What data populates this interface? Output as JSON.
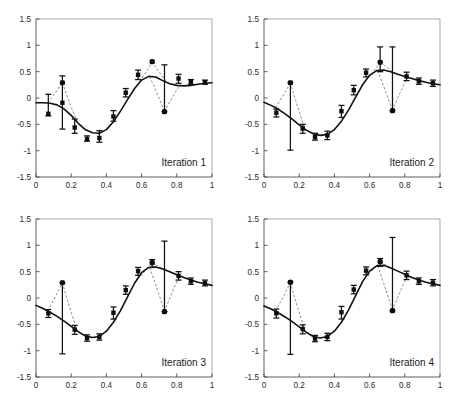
{
  "figure": {
    "title": "",
    "panel_count": 4,
    "background_color": "#ffffff",
    "curve_color": "#111111",
    "marker_color": "#0d0d0d",
    "dashed_link_color": "#6e6e6e",
    "axis_color": "#4d4d4d"
  },
  "axes": {
    "xlim": [
      0,
      1
    ],
    "ylim": [
      -1.5,
      1.5
    ],
    "xticks": [
      0,
      0.2,
      0.4,
      0.6,
      0.8,
      1
    ],
    "xtick_labels": [
      "0",
      "0.2",
      "0.4",
      "0.6",
      "0.8",
      "1"
    ],
    "yticks": [
      -1.5,
      -1,
      -0.5,
      0,
      0.5,
      1,
      1.5
    ],
    "ytick_labels": [
      "-1.5",
      "-1",
      "-0.5",
      "0",
      "0.5",
      "1",
      "1.5"
    ],
    "xlabel": "",
    "ylabel": "",
    "grid": false
  },
  "chart_data": [
    {
      "type": "line",
      "title": "Iteration 1",
      "xlabel": "",
      "ylabel": "",
      "xlim": [
        0,
        1
      ],
      "ylim": [
        -1.5,
        1.5
      ],
      "grid": false,
      "legend": "none",
      "series": [
        {
          "name": "fitted curve",
          "style": "solid",
          "x": [
            0.0,
            0.04,
            0.08,
            0.12,
            0.16,
            0.2,
            0.24,
            0.28,
            0.32,
            0.36,
            0.4,
            0.44,
            0.48,
            0.52,
            0.56,
            0.6,
            0.64,
            0.68,
            0.72,
            0.76,
            0.8,
            0.84,
            0.88,
            0.92,
            0.96,
            1.0
          ],
          "values": [
            -0.09,
            -0.09,
            -0.1,
            -0.13,
            -0.21,
            -0.33,
            -0.48,
            -0.6,
            -0.66,
            -0.67,
            -0.6,
            -0.45,
            -0.25,
            -0.03,
            0.18,
            0.34,
            0.41,
            0.4,
            0.33,
            0.27,
            0.24,
            0.23,
            0.24,
            0.26,
            0.28,
            0.29
          ]
        },
        {
          "name": "observations with error bars",
          "style": "markers-errorbars",
          "x": [
            0.07,
            0.15,
            0.15,
            0.22,
            0.29,
            0.36,
            0.44,
            0.51,
            0.58,
            0.66,
            0.73,
            0.81,
            0.88,
            0.96
          ],
          "values": [
            -0.3,
            0.29,
            -0.09,
            -0.56,
            -0.78,
            -0.76,
            -0.35,
            0.1,
            0.44,
            0.69,
            -0.26,
            0.37,
            0.31,
            0.3
          ],
          "err_low": [
            -0.34,
            0.29,
            -0.59,
            -0.67,
            -0.82,
            -0.84,
            -0.44,
            0.02,
            0.35,
            0.69,
            -0.26,
            0.28,
            0.26,
            0.26
          ],
          "err_high": [
            0.07,
            0.29,
            0.42,
            -0.4,
            -0.72,
            -0.62,
            -0.24,
            0.18,
            0.53,
            0.69,
            0.63,
            0.45,
            0.35,
            0.34
          ]
        }
      ],
      "outliers": [
        {
          "x": 0.15,
          "y": 0.29
        },
        {
          "x": 0.66,
          "y": 0.69
        },
        {
          "x": 0.73,
          "y": -0.26
        }
      ]
    },
    {
      "type": "line",
      "title": "Iteration 2",
      "xlabel": "",
      "ylabel": "",
      "xlim": [
        0,
        1
      ],
      "ylim": [
        -1.5,
        1.5
      ],
      "grid": false,
      "legend": "none",
      "series": [
        {
          "name": "fitted curve",
          "style": "solid",
          "x": [
            0.0,
            0.04,
            0.08,
            0.12,
            0.16,
            0.2,
            0.24,
            0.28,
            0.32,
            0.36,
            0.4,
            0.44,
            0.48,
            0.52,
            0.56,
            0.6,
            0.64,
            0.68,
            0.72,
            0.76,
            0.8,
            0.84,
            0.88,
            0.92,
            0.96,
            1.0
          ],
          "values": [
            -0.08,
            -0.14,
            -0.21,
            -0.3,
            -0.4,
            -0.51,
            -0.61,
            -0.68,
            -0.71,
            -0.69,
            -0.6,
            -0.44,
            -0.23,
            0.01,
            0.25,
            0.43,
            0.52,
            0.53,
            0.5,
            0.45,
            0.41,
            0.37,
            0.33,
            0.3,
            0.27,
            0.25
          ]
        },
        {
          "name": "observations with error bars",
          "style": "markers-errorbars",
          "x": [
            0.07,
            0.15,
            0.22,
            0.29,
            0.36,
            0.44,
            0.51,
            0.58,
            0.66,
            0.73,
            0.81,
            0.88,
            0.96
          ],
          "values": [
            -0.28,
            0.29,
            -0.58,
            -0.74,
            -0.71,
            -0.25,
            0.15,
            0.48,
            0.68,
            -0.24,
            0.41,
            0.32,
            0.28
          ],
          "err_low": [
            -0.36,
            -0.99,
            -0.67,
            -0.8,
            -0.79,
            -0.37,
            0.06,
            0.4,
            0.5,
            -0.24,
            0.33,
            0.26,
            0.22
          ],
          "err_high": [
            -0.21,
            0.29,
            -0.5,
            -0.67,
            -0.63,
            -0.14,
            0.24,
            0.55,
            0.97,
            0.97,
            0.49,
            0.38,
            0.34
          ]
        }
      ],
      "outliers": [
        {
          "x": 0.15,
          "y": 0.29
        },
        {
          "x": 0.66,
          "y": 0.68
        },
        {
          "x": 0.73,
          "y": -0.24
        }
      ]
    },
    {
      "type": "line",
      "title": "Iteration 3",
      "xlabel": "",
      "ylabel": "",
      "xlim": [
        0,
        1
      ],
      "ylim": [
        -1.5,
        1.5
      ],
      "grid": false,
      "legend": "none",
      "series": [
        {
          "name": "fitted curve",
          "style": "solid",
          "x": [
            0.0,
            0.04,
            0.08,
            0.12,
            0.16,
            0.2,
            0.24,
            0.28,
            0.32,
            0.36,
            0.4,
            0.44,
            0.48,
            0.52,
            0.56,
            0.6,
            0.64,
            0.68,
            0.72,
            0.76,
            0.8,
            0.84,
            0.88,
            0.92,
            0.96,
            1.0
          ],
          "values": [
            -0.14,
            -0.2,
            -0.27,
            -0.35,
            -0.44,
            -0.54,
            -0.64,
            -0.72,
            -0.75,
            -0.73,
            -0.63,
            -0.46,
            -0.24,
            0.02,
            0.28,
            0.48,
            0.58,
            0.59,
            0.55,
            0.5,
            0.44,
            0.39,
            0.34,
            0.3,
            0.27,
            0.24
          ]
        },
        {
          "name": "observations with error bars",
          "style": "markers-errorbars",
          "x": [
            0.07,
            0.15,
            0.22,
            0.29,
            0.36,
            0.44,
            0.51,
            0.58,
            0.66,
            0.73,
            0.81,
            0.88,
            0.96
          ],
          "values": [
            -0.29,
            0.29,
            -0.6,
            -0.76,
            -0.74,
            -0.28,
            0.15,
            0.51,
            0.67,
            -0.26,
            0.42,
            0.32,
            0.28
          ],
          "err_low": [
            -0.37,
            -1.06,
            -0.69,
            -0.82,
            -0.8,
            -0.4,
            0.07,
            0.43,
            0.58,
            -0.26,
            0.34,
            0.26,
            0.23
          ],
          "err_high": [
            -0.22,
            0.29,
            -0.52,
            -0.7,
            -0.68,
            -0.17,
            0.23,
            0.58,
            0.73,
            1.08,
            0.5,
            0.38,
            0.34
          ]
        }
      ],
      "outliers": [
        {
          "x": 0.15,
          "y": 0.29
        },
        {
          "x": 0.66,
          "y": 0.67
        },
        {
          "x": 0.73,
          "y": -0.26
        }
      ]
    },
    {
      "type": "line",
      "title": "Iteration 4",
      "xlabel": "",
      "ylabel": "",
      "xlim": [
        0,
        1
      ],
      "ylim": [
        -1.5,
        1.5
      ],
      "grid": false,
      "legend": "none",
      "series": [
        {
          "name": "fitted curve",
          "style": "solid",
          "x": [
            0.0,
            0.04,
            0.08,
            0.12,
            0.16,
            0.2,
            0.24,
            0.28,
            0.32,
            0.36,
            0.4,
            0.44,
            0.48,
            0.52,
            0.56,
            0.6,
            0.64,
            0.68,
            0.72,
            0.76,
            0.8,
            0.84,
            0.88,
            0.92,
            0.96,
            1.0
          ],
          "values": [
            -0.15,
            -0.21,
            -0.28,
            -0.36,
            -0.45,
            -0.55,
            -0.65,
            -0.73,
            -0.76,
            -0.73,
            -0.63,
            -0.46,
            -0.23,
            0.04,
            0.31,
            0.51,
            0.61,
            0.62,
            0.57,
            0.51,
            0.45,
            0.39,
            0.34,
            0.3,
            0.27,
            0.24
          ]
        },
        {
          "name": "observations with error bars",
          "style": "markers-errorbars",
          "x": [
            0.07,
            0.15,
            0.22,
            0.29,
            0.36,
            0.44,
            0.51,
            0.58,
            0.66,
            0.73,
            0.81,
            0.88,
            0.96
          ],
          "values": [
            -0.29,
            0.3,
            -0.59,
            -0.77,
            -0.74,
            -0.27,
            0.16,
            0.52,
            0.69,
            -0.24,
            0.43,
            0.32,
            0.29
          ],
          "err_low": [
            -0.38,
            -1.07,
            -0.68,
            -0.83,
            -0.81,
            -0.4,
            0.08,
            0.44,
            0.6,
            -0.24,
            0.35,
            0.26,
            0.23
          ],
          "err_high": [
            -0.21,
            0.3,
            -0.51,
            -0.71,
            -0.67,
            -0.16,
            0.24,
            0.59,
            0.75,
            1.15,
            0.51,
            0.38,
            0.35
          ]
        }
      ],
      "outliers": [
        {
          "x": 0.15,
          "y": 0.3
        },
        {
          "x": 0.66,
          "y": 0.69
        },
        {
          "x": 0.73,
          "y": -0.24
        }
      ]
    }
  ]
}
